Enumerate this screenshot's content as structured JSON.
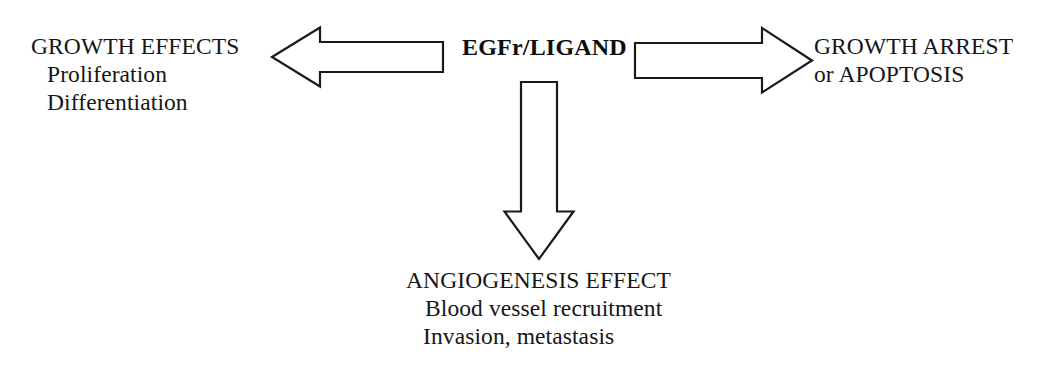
{
  "diagram": {
    "stroke_color": "#1a1a1a",
    "fill_color": "#ffffff",
    "background_color": "#ffffff",
    "hub": {
      "label": "EGFr/LIGAND"
    },
    "branches": {
      "left": {
        "arrow_direction": "left",
        "heading": "GROWTH EFFECTS",
        "items": [
          "Proliferation",
          "Differentiation"
        ]
      },
      "right": {
        "arrow_direction": "right",
        "heading": "GROWTH ARREST",
        "items": [
          "or APOPTOSIS"
        ]
      },
      "down": {
        "arrow_direction": "down",
        "heading": "ANGIOGENESIS EFFECT",
        "items": [
          "Blood vessel recruitment",
          "Invasion, metastasis"
        ]
      }
    }
  }
}
